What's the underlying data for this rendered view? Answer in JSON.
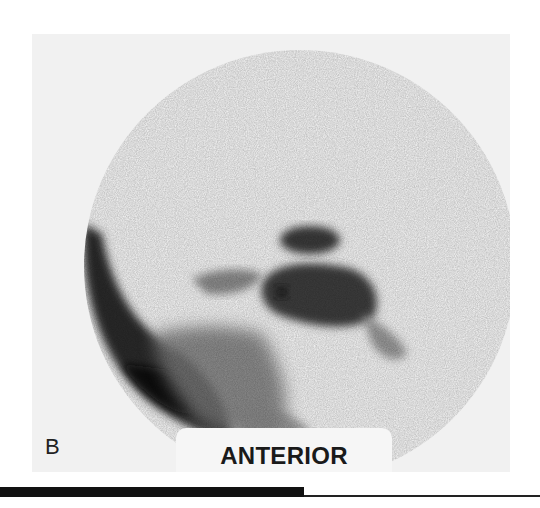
{
  "figure": {
    "panel_letter": "B",
    "view_label": "ANTERIOR",
    "image_type": "grayscale scintigraphy scan",
    "colors": {
      "panel_background": "#f1f1f1",
      "page_background": "#ffffff",
      "uptake_dark": "#1e1e1e",
      "uptake_mid": "#6a6a6a",
      "rule": "#111111"
    }
  }
}
